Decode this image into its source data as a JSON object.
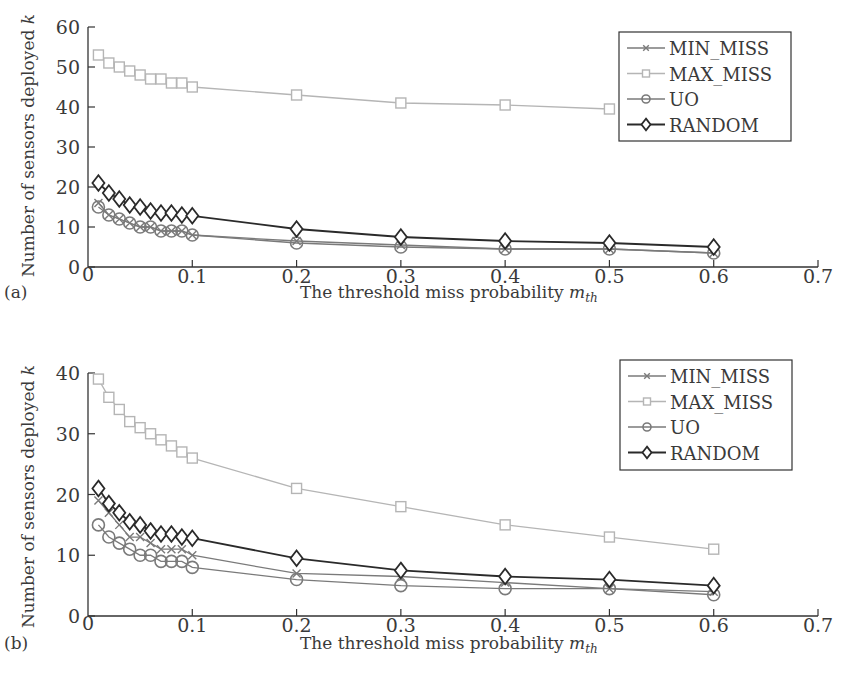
{
  "figure": {
    "panel_labels": [
      "(a)",
      "(b)"
    ]
  },
  "chart_data": [
    {
      "type": "line",
      "panel": "(a)",
      "title": "",
      "xlabel": "The threshold miss probability m_th",
      "xlabel_main": "The threshold miss probability ",
      "xlabel_var": "m",
      "xlabel_sub": "th",
      "ylabel": "Number of sensors deployed k",
      "ylabel_main": "Number of sensors deployed ",
      "ylabel_var": "k",
      "xlim": [
        0,
        0.7
      ],
      "ylim": [
        0,
        60
      ],
      "xticks": [
        0,
        0.1,
        0.2,
        0.3,
        0.4,
        0.5,
        0.6,
        0.7
      ],
      "xtick_labels": [
        "0",
        "0.1",
        "0.2",
        "0.3",
        "0.4",
        "0.5",
        "0.6",
        "0.7"
      ],
      "yticks": [
        0,
        10,
        20,
        30,
        40,
        50,
        60
      ],
      "ytick_labels": [
        "0",
        "10",
        "20",
        "30",
        "40",
        "50",
        "60"
      ],
      "grid": false,
      "legend_position": "upper right",
      "x": [
        0.01,
        0.02,
        0.03,
        0.04,
        0.05,
        0.06,
        0.07,
        0.08,
        0.09,
        0.1,
        0.2,
        0.3,
        0.4,
        0.5,
        0.6
      ],
      "series": [
        {
          "name": "MIN_MISS",
          "marker": "x",
          "color": "#7a7a7a",
          "values": [
            16,
            13,
            12,
            11,
            10,
            10,
            9,
            9,
            9,
            8,
            6.5,
            5.5,
            4.5,
            4.5,
            3.5
          ]
        },
        {
          "name": "MAX_MISS",
          "marker": "square",
          "color": "#b5b5b5",
          "values": [
            53,
            51,
            50,
            49,
            48,
            47,
            47,
            46,
            46,
            45,
            43,
            41,
            40.5,
            39.5,
            null
          ]
        },
        {
          "name": "UO",
          "marker": "circle",
          "color": "#7a7a7a",
          "values": [
            15,
            13,
            12,
            11,
            10,
            10,
            9,
            9,
            9,
            8,
            6,
            5,
            4.5,
            4.5,
            3.5
          ]
        },
        {
          "name": "RANDOM",
          "marker": "diamond",
          "color": "#2a2a2a",
          "values": [
            21,
            18.5,
            17,
            15.5,
            15,
            14,
            13.5,
            13.5,
            13,
            12.8,
            9.5,
            7.5,
            6.5,
            6,
            5
          ]
        }
      ]
    },
    {
      "type": "line",
      "panel": "(b)",
      "title": "",
      "xlabel": "The threshold miss probability m_th",
      "xlabel_main": "The threshold miss probability ",
      "xlabel_var": "m",
      "xlabel_sub": "th",
      "ylabel": "Number of sensors deployed k",
      "ylabel_main": "Number of sensors deployed ",
      "ylabel_var": "k",
      "xlim": [
        0,
        0.7
      ],
      "ylim": [
        0,
        40
      ],
      "xticks": [
        0,
        0.1,
        0.2,
        0.3,
        0.4,
        0.5,
        0.6,
        0.7
      ],
      "xtick_labels": [
        "0",
        "0.1",
        "0.2",
        "0.3",
        "0.4",
        "0.5",
        "0.6",
        "0.7"
      ],
      "yticks": [
        0,
        10,
        20,
        30,
        40
      ],
      "ytick_labels": [
        "0",
        "10",
        "20",
        "30",
        "40"
      ],
      "grid": false,
      "legend_position": "upper right",
      "x": [
        0.01,
        0.02,
        0.03,
        0.04,
        0.05,
        0.06,
        0.07,
        0.08,
        0.09,
        0.1,
        0.2,
        0.3,
        0.4,
        0.5,
        0.6
      ],
      "series": [
        {
          "name": "MIN_MISS",
          "marker": "x",
          "color": "#7a7a7a",
          "values": [
            19,
            17,
            15,
            13,
            13,
            12,
            11,
            11,
            11,
            10,
            7,
            6.5,
            5.5,
            4.5,
            4
          ]
        },
        {
          "name": "MAX_MISS",
          "marker": "square",
          "color": "#b5b5b5",
          "values": [
            39,
            36,
            34,
            32,
            31,
            30,
            29,
            28,
            27,
            26,
            21,
            18,
            15,
            13,
            11
          ]
        },
        {
          "name": "UO",
          "marker": "circle",
          "color": "#7a7a7a",
          "values": [
            15,
            13,
            12,
            11,
            10,
            10,
            9,
            9,
            9,
            8,
            6,
            5,
            4.5,
            4.5,
            3.5
          ]
        },
        {
          "name": "RANDOM",
          "marker": "diamond",
          "color": "#2a2a2a",
          "values": [
            21,
            18.5,
            17,
            15.5,
            15,
            14,
            13.5,
            13.5,
            13,
            12.8,
            9.5,
            7.5,
            6.5,
            6,
            5
          ]
        }
      ]
    }
  ]
}
